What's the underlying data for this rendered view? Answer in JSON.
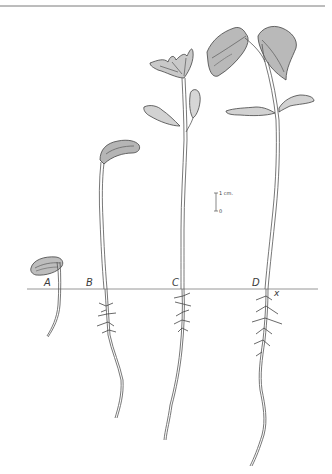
{
  "figure": {
    "colors": {
      "ink": "#4a4a4a",
      "line": "#8a8a8a",
      "background": "#ffffff"
    }
  },
  "labels": {
    "stage_a": "A",
    "stage_b": "B",
    "stage_c": "C",
    "stage_d": "D",
    "ground_marker": "x"
  },
  "scale_bar": {
    "top_label": "1 cm.",
    "bottom_label": "0"
  },
  "stages": [
    {
      "id": "A",
      "name": "seed with emerging radicle"
    },
    {
      "id": "B",
      "name": "hooked hypocotyl emerging"
    },
    {
      "id": "C",
      "name": "cotyledons open, first leaves unfolding"
    },
    {
      "id": "D",
      "name": "primary leaves expanded"
    }
  ]
}
